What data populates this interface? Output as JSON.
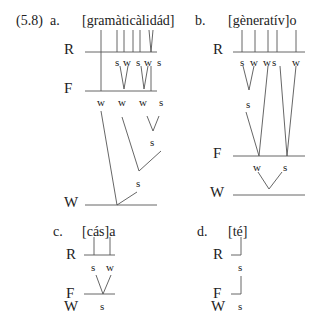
{
  "example": {
    "number": "(5.8)",
    "panels": [
      {
        "label": "a.",
        "word": "[gramàticàlidád]",
        "tiers": [
          "R",
          "F",
          "W"
        ],
        "r_nodes": [
          "s",
          "w",
          "s",
          "w",
          "s"
        ],
        "f_nodes": [
          "w",
          "w",
          "w",
          "s"
        ],
        "inner_nodes": [
          "s",
          "s"
        ]
      },
      {
        "label": "b.",
        "word": "[gèneratív]o",
        "tiers": [
          "R",
          "F",
          "W"
        ],
        "r_nodes": [
          "s",
          "w",
          "w",
          "s",
          "w"
        ],
        "inner_nodes": [
          "s"
        ],
        "f_nodes": [
          "w",
          "s"
        ]
      },
      {
        "label": "c.",
        "word": "[cás]a",
        "tiers": [
          "R",
          "F",
          "W"
        ],
        "r_nodes": [
          "s",
          "w"
        ],
        "f_nodes": [
          "s"
        ]
      },
      {
        "label": "d.",
        "word": "[té]",
        "tiers": [
          "R",
          "F",
          "W"
        ],
        "r_nodes": [
          "s"
        ],
        "f_nodes": [
          "s"
        ]
      }
    ]
  }
}
